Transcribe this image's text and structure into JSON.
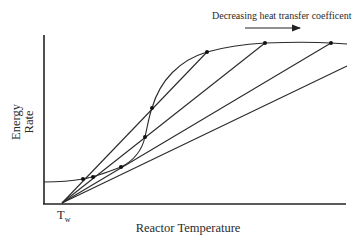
{
  "figure": {
    "annotation": "Decreasing heat transfer coefficent",
    "x_axis_label": "Reactor Temperature",
    "y_axis_label_line1": "Energy",
    "y_axis_label_line2": "Rate",
    "origin_label_main": "T",
    "origin_label_sub": "w",
    "arrow_direction": "right"
  },
  "diagram": {
    "type": "energy-balance",
    "generation_curve": "sigmoid rising from a low plateau to a high plateau",
    "removal_lines": [
      {
        "name": "line-1",
        "origin": "T_w",
        "intersections": 3
      },
      {
        "name": "line-2",
        "origin": "T_w",
        "intersections": 3
      },
      {
        "name": "line-3",
        "origin": "T_w",
        "intersections": 2
      },
      {
        "name": "line-4",
        "origin": "T_w",
        "intersections": 0
      }
    ],
    "colors": {
      "ink": "#2a2a2a",
      "background": "#ffffff"
    }
  }
}
